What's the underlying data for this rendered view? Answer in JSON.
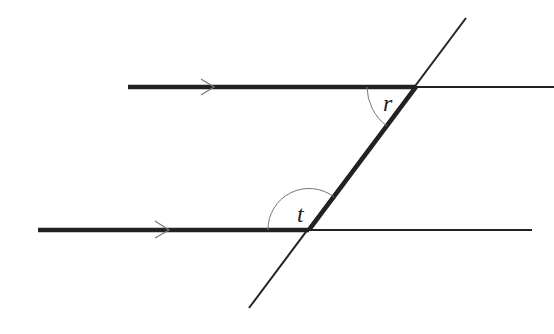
{
  "diagram": {
    "colors": {
      "line": "#222222",
      "arc": "#777777",
      "background": "#ffffff"
    },
    "upper_line": {
      "start": [
        128,
        87
      ],
      "thick_end": [
        416,
        87
      ],
      "end": [
        554,
        87
      ],
      "arrow_at": [
        212,
        87
      ]
    },
    "lower_line": {
      "start": [
        38,
        230
      ],
      "thick_end": [
        309,
        230
      ],
      "end": [
        532,
        230
      ],
      "arrow_at": [
        170,
        230
      ]
    },
    "transversal": {
      "top": [
        466,
        18
      ],
      "bottom": [
        249,
        308
      ],
      "thick_segment": [
        [
          416,
          87
        ],
        [
          309,
          230
        ]
      ]
    },
    "angles": [
      {
        "label": "r",
        "vertex": [
          416,
          87
        ],
        "position": "inside-left-below-upper"
      },
      {
        "label": "t",
        "vertex": [
          309,
          230
        ],
        "position": "above-left-lower"
      }
    ]
  }
}
